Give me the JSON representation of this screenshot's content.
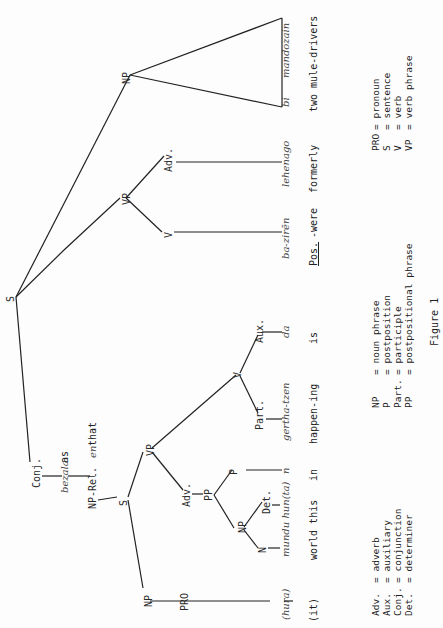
{
  "figure": {
    "caption": "Figure 1",
    "orientation": "rotated 90deg counter-clockwise",
    "nodes": {
      "S_root": "S",
      "conj": "Conj.",
      "np_rel": "NP-Rel.",
      "s_sub": "S",
      "np_subj": "NP",
      "pro": "PRO",
      "vp_sub": "VP",
      "adv_sub": "Adv.",
      "pp": "PP",
      "np_pp": "NP",
      "p": "P",
      "n": "N",
      "det": "Det.",
      "v_sub": "V",
      "part": "Part.",
      "aux": "Aux.",
      "vp_main": "VP",
      "v_main": "V",
      "adv_main": "Adv.",
      "np_obj": "NP"
    },
    "words": {
      "conj_word": "bezala",
      "conj_gloss": "as",
      "rel_word": "en",
      "rel_gloss": "that",
      "pro_word": "(hura)",
      "pro_gloss": "(it)",
      "n_det_word": "mundu hun(ta)",
      "n_det_gloss": "world this",
      "p_word": "n",
      "p_gloss": "in",
      "part_word": "gertha-tzen",
      "part_gloss": "happen-ing",
      "aux_word": "da",
      "aux_gloss": "is",
      "v_word": "ba-zirēn",
      "v_gloss_pos": "Pos.",
      "v_gloss_rest": "-were",
      "adv_word": "lehenago",
      "adv_gloss": "formerly",
      "np_word1": "bi",
      "np_word2": "mandozain",
      "np_gloss": "two mule-drivers"
    },
    "legend": {
      "col1": [
        {
          "abbr": "Adv.",
          "meaning": "= adverb"
        },
        {
          "abbr": "Aux.",
          "meaning": "= auxiliary"
        },
        {
          "abbr": "Conj.",
          "meaning": "= conjunction"
        },
        {
          "abbr": "Det.",
          "meaning": "= determiner"
        }
      ],
      "col2": [
        {
          "abbr": "NP",
          "meaning": "= noun phrase"
        },
        {
          "abbr": "P",
          "meaning": "= postposition"
        },
        {
          "abbr": "Part.",
          "meaning": "= participle"
        },
        {
          "abbr": "PP",
          "meaning": "= postpositional phrase"
        }
      ],
      "col3": [
        {
          "abbr": "PRO",
          "meaning": "= pronoun"
        },
        {
          "abbr": "S",
          "meaning": "= sentence"
        },
        {
          "abbr": "V",
          "meaning": "= verb"
        },
        {
          "abbr": "VP",
          "meaning": "= verb phrase"
        }
      ]
    }
  }
}
